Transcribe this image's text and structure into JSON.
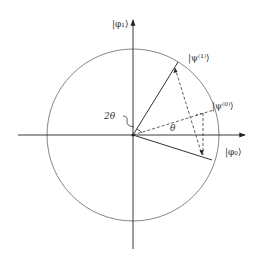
{
  "diagram": {
    "type": "geometric rotation diagram",
    "axes": {
      "horizontal_label": "|φ₀⟩",
      "vertical_label": "|φ₁⟩"
    },
    "vectors": [
      {
        "label": "|ψ⁽¹⁾⟩",
        "style": "solid"
      },
      {
        "label": "|ψ⁽⁰⁾⟩",
        "style": "dashed"
      },
      {
        "label": "reflected",
        "style": "solid"
      }
    ],
    "angles": {
      "theta": "θ",
      "two_theta": "2θ"
    }
  },
  "colors": {
    "line": "#333333",
    "circle": "#777777",
    "background": "#ffffff"
  }
}
